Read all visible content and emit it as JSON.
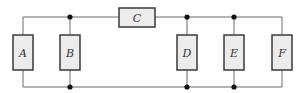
{
  "diagram": {
    "type": "circuit",
    "components": [
      {
        "id": "A",
        "label": "A",
        "orientation": "vertical"
      },
      {
        "id": "B",
        "label": "B",
        "orientation": "vertical"
      },
      {
        "id": "C",
        "label": "C",
        "orientation": "horizontal"
      },
      {
        "id": "D",
        "label": "D",
        "orientation": "vertical"
      },
      {
        "id": "E",
        "label": "E",
        "orientation": "vertical"
      },
      {
        "id": "F",
        "label": "F",
        "orientation": "vertical"
      }
    ],
    "colors": {
      "wire": "#6b6b6b",
      "box_fill": "#ececec",
      "box_stroke": "#3a3a3a",
      "node": "#111111"
    }
  }
}
